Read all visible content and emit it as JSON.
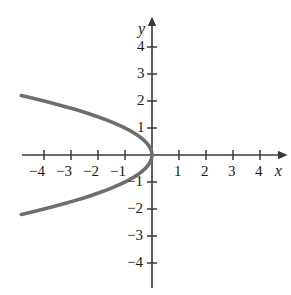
{
  "chart_data": {
    "type": "line",
    "title": "",
    "xlabel": "x",
    "ylabel": "y",
    "xlim": [
      -5.2,
      4.9
    ],
    "ylim": [
      -5.0,
      5.0
    ],
    "grid": false,
    "legend": null,
    "equation": "x = -y^2",
    "xticks": [
      -4,
      -3,
      -2,
      -1,
      1,
      2,
      3,
      4
    ],
    "xtick_labels": [
      "−4",
      "−3",
      "−2",
      "−1",
      "1",
      "2",
      "3",
      "4"
    ],
    "yticks": [
      4,
      3,
      2,
      1,
      -1,
      -2,
      -3,
      -4
    ],
    "ytick_labels": [
      "4",
      "3",
      "2",
      "1",
      "−1",
      "−2",
      "−3",
      "−4"
    ],
    "series": [
      {
        "name": "x = -y^2",
        "color": "#6e6e6e",
        "points": [
          {
            "x": -4.84,
            "y": 2.2
          },
          {
            "x": -4.41,
            "y": 2.1
          },
          {
            "x": -4.0,
            "y": 2.0
          },
          {
            "x": -3.61,
            "y": 1.9
          },
          {
            "x": -3.24,
            "y": 1.8
          },
          {
            "x": -2.89,
            "y": 1.7
          },
          {
            "x": -2.56,
            "y": 1.6
          },
          {
            "x": -2.25,
            "y": 1.5
          },
          {
            "x": -1.96,
            "y": 1.4
          },
          {
            "x": -1.69,
            "y": 1.3
          },
          {
            "x": -1.44,
            "y": 1.2
          },
          {
            "x": -1.21,
            "y": 1.1
          },
          {
            "x": -1.0,
            "y": 1.0
          },
          {
            "x": -0.81,
            "y": 0.9
          },
          {
            "x": -0.64,
            "y": 0.8
          },
          {
            "x": -0.49,
            "y": 0.7
          },
          {
            "x": -0.36,
            "y": 0.6
          },
          {
            "x": -0.25,
            "y": 0.5
          },
          {
            "x": -0.16,
            "y": 0.4
          },
          {
            "x": -0.09,
            "y": 0.3
          },
          {
            "x": -0.04,
            "y": 0.2
          },
          {
            "x": -0.01,
            "y": 0.1
          },
          {
            "x": 0.0,
            "y": 0.0
          },
          {
            "x": -0.01,
            "y": -0.1
          },
          {
            "x": -0.04,
            "y": -0.2
          },
          {
            "x": -0.09,
            "y": -0.3
          },
          {
            "x": -0.16,
            "y": -0.4
          },
          {
            "x": -0.25,
            "y": -0.5
          },
          {
            "x": -0.36,
            "y": -0.6
          },
          {
            "x": -0.49,
            "y": -0.7
          },
          {
            "x": -0.64,
            "y": -0.8
          },
          {
            "x": -0.81,
            "y": -0.9
          },
          {
            "x": -1.0,
            "y": -1.0
          },
          {
            "x": -1.21,
            "y": -1.1
          },
          {
            "x": -1.44,
            "y": -1.2
          },
          {
            "x": -1.69,
            "y": -1.3
          },
          {
            "x": -1.96,
            "y": -1.4
          },
          {
            "x": -2.25,
            "y": -1.5
          },
          {
            "x": -2.56,
            "y": -1.6
          },
          {
            "x": -2.89,
            "y": -1.7
          },
          {
            "x": -3.24,
            "y": -1.8
          },
          {
            "x": -3.61,
            "y": -1.9
          },
          {
            "x": -4.0,
            "y": -2.0
          },
          {
            "x": -4.41,
            "y": -2.1
          },
          {
            "x": -4.84,
            "y": -2.2
          }
        ]
      }
    ],
    "axes": {
      "origin_px": {
        "x": 152,
        "y": 155
      },
      "unit_px": 27,
      "axis_color": "#3a3a3a",
      "x_axis_arrow": true,
      "y_axis_arrow": true
    }
  }
}
